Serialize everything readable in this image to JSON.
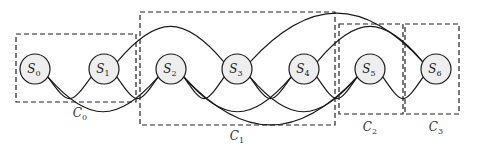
{
  "nodes": [
    {
      "id": "S0",
      "base": "S",
      "sub": "0",
      "x": 35,
      "y": 69
    },
    {
      "id": "S1",
      "base": "S",
      "sub": "1",
      "x": 104,
      "y": 69
    },
    {
      "id": "S2",
      "base": "S",
      "sub": "2",
      "x": 171,
      "y": 69
    },
    {
      "id": "S3",
      "base": "S",
      "sub": "3",
      "x": 237,
      "y": 69
    },
    {
      "id": "S4",
      "base": "S",
      "sub": "4",
      "x": 304,
      "y": 69
    },
    {
      "id": "S5",
      "base": "S",
      "sub": "5",
      "x": 370,
      "y": 69
    },
    {
      "id": "S6",
      "base": "S",
      "sub": "6",
      "x": 436,
      "y": 69
    }
  ],
  "clusters": [
    {
      "id": "C0",
      "base": "C",
      "sub": "0",
      "x": 16,
      "y": 34,
      "w": 120,
      "h": 68,
      "label_x": 80,
      "label_y": 117
    },
    {
      "id": "C1",
      "base": "C",
      "sub": "1",
      "x": 140,
      "y": 12,
      "w": 195,
      "h": 113,
      "label_x": 237,
      "label_y": 140
    },
    {
      "id": "C2",
      "base": "C",
      "sub": "2",
      "x": 339,
      "y": 24,
      "w": 64,
      "h": 90,
      "label_x": 370,
      "label_y": 131
    },
    {
      "id": "C3",
      "base": "C",
      "sub": "3",
      "x": 405,
      "y": 24,
      "w": 54,
      "h": 90,
      "label_x": 436,
      "label_y": 131
    }
  ],
  "edges": [
    {
      "from": "S0",
      "to": "S1",
      "side": "below"
    },
    {
      "from": "S0",
      "to": "S2",
      "side": "below"
    },
    {
      "from": "S1",
      "to": "S2",
      "side": "below"
    },
    {
      "from": "S1",
      "to": "S3",
      "side": "above"
    },
    {
      "from": "S2",
      "to": "S3",
      "side": "below"
    },
    {
      "from": "S2",
      "to": "S4",
      "side": "below"
    },
    {
      "from": "S2",
      "to": "S5",
      "side": "below"
    },
    {
      "from": "S3",
      "to": "S4",
      "side": "below"
    },
    {
      "from": "S3",
      "to": "S5",
      "side": "below"
    },
    {
      "from": "S3",
      "to": "S6",
      "side": "above"
    },
    {
      "from": "S4",
      "to": "S5",
      "side": "below"
    },
    {
      "from": "S4",
      "to": "S6",
      "side": "above"
    },
    {
      "from": "S5",
      "to": "S6",
      "side": "below"
    }
  ]
}
